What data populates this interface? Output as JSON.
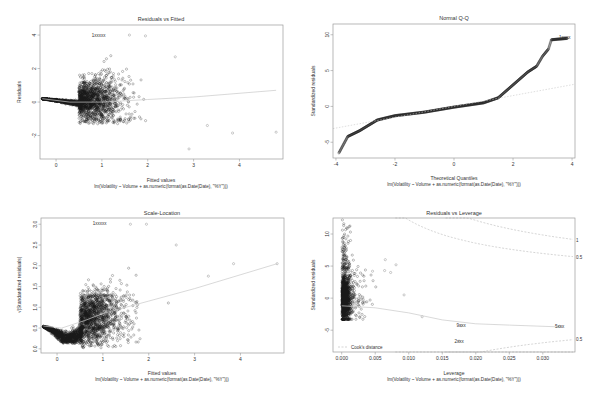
{
  "figure": {
    "subtitle": "lm(Volatility ~ Volume + as.numeric(format(as.Date(Date), \"%Y\")))",
    "colors": {
      "axis": "#9a9a9a",
      "points": "#1a1a1a",
      "smooth": "#c8c8c8",
      "cook": "#b8b8b8",
      "text": "#333333"
    }
  },
  "chart_data": [
    {
      "type": "scatter",
      "title": "Residuals vs Fitted",
      "xlabel": "Fitted values",
      "ylabel": "Residuals",
      "subtitle": "lm(Volatility ~ Volume + as.numeric(format(as.Date(Date), \"%Y\")))",
      "xlim": [
        -0.35,
        4.95
      ],
      "ylim": [
        -3.4,
        4.6
      ],
      "xticks": [
        0,
        1,
        2,
        3,
        4
      ],
      "yticks": [
        -2,
        0,
        2,
        4
      ],
      "box": [
        40,
        25,
        283,
        159
      ],
      "annotations": [
        {
          "label": "1xxxxx",
          "x": 0.93,
          "y": 4.0
        }
      ],
      "smooth_line": [
        [
          -0.3,
          0.2
        ],
        [
          0.3,
          0.0
        ],
        [
          1.0,
          0.0
        ],
        [
          2.0,
          0.15
        ],
        [
          3.0,
          0.3
        ],
        [
          4.8,
          0.7
        ]
      ],
      "notable_points": [
        [
          3.3,
          -1.4
        ],
        [
          3.85,
          -1.85
        ],
        [
          4.8,
          -1.8
        ],
        [
          2.9,
          -2.8
        ],
        [
          2.6,
          2.7
        ],
        [
          1.6,
          4.0
        ],
        [
          1.95,
          3.95
        ]
      ]
    },
    {
      "type": "scatter",
      "title": "Normal Q-Q",
      "xlabel": "Theoretical Quantiles",
      "ylabel": "Standardized residuals",
      "subtitle": "lm(Volatility ~ Volume + as.numeric(format(as.Date(Date), \"%Y\")))",
      "xlim": [
        -4.1,
        4.1
      ],
      "ylim": [
        -7.2,
        11.5
      ],
      "xticks": [
        -4,
        -2,
        0,
        2,
        4
      ],
      "yticks": [
        -5,
        0,
        5,
        10
      ],
      "box": [
        333,
        24,
        575,
        158
      ],
      "annotations": [
        {
          "label": "1xxxx",
          "x": 3.75,
          "y": 9.6
        }
      ],
      "reference_line": [
        [
          -4.1,
          -3.1
        ],
        [
          4.1,
          3.1
        ]
      ],
      "qq_curve": [
        [
          -3.9,
          -6.5
        ],
        [
          -3.6,
          -4.2
        ],
        [
          -3.2,
          -3.4
        ],
        [
          -2.6,
          -1.9
        ],
        [
          -2.0,
          -1.3
        ],
        [
          -1.0,
          -0.8
        ],
        [
          0.0,
          -0.1
        ],
        [
          1.0,
          0.5
        ],
        [
          1.5,
          1.2
        ],
        [
          2.0,
          3.0
        ],
        [
          2.5,
          4.8
        ],
        [
          2.8,
          5.6
        ],
        [
          3.0,
          7.0
        ],
        [
          3.2,
          8.0
        ],
        [
          3.3,
          9.3
        ],
        [
          3.85,
          9.5
        ]
      ]
    },
    {
      "type": "scatter",
      "title": "Scale-Location",
      "xlabel": "Fitted values",
      "ylabel": "√|Standardized residuals|",
      "subtitle": "lm(Volatility ~ Volume + as.numeric(format(as.Date(Date), \"%Y\")))",
      "xlim": [
        -0.35,
        4.95
      ],
      "ylim": [
        -0.1,
        3.15
      ],
      "xticks": [
        0,
        1,
        2,
        3,
        4
      ],
      "yticks": [
        0.0,
        0.5,
        1.0,
        1.5,
        2.0,
        2.5,
        3.0
      ],
      "box": [
        41,
        218,
        284,
        353
      ],
      "annotations": [
        {
          "label": "1xxxxx",
          "x": 0.93,
          "y": 3.02
        }
      ],
      "smooth_line": [
        [
          -0.3,
          0.55
        ],
        [
          0.1,
          0.5
        ],
        [
          0.6,
          0.68
        ],
        [
          1.0,
          0.85
        ],
        [
          1.5,
          1.0
        ],
        [
          2.0,
          1.15
        ],
        [
          3.0,
          1.45
        ],
        [
          4.8,
          2.05
        ]
      ],
      "notable_points": [
        [
          3.85,
          2.05
        ],
        [
          4.8,
          2.05
        ],
        [
          3.3,
          1.75
        ],
        [
          2.6,
          2.5
        ],
        [
          1.6,
          3.0
        ],
        [
          1.95,
          3.0
        ]
      ]
    },
    {
      "type": "scatter",
      "title": "Residuals vs Leverage",
      "xlabel": "Leverage",
      "ylabel": "Standardized residuals",
      "subtitle": "lm(Volatility ~ Volume + as.numeric(format(as.Date(Date), \"%Y\")))",
      "xlim": [
        -0.0013,
        0.0348
      ],
      "ylim": [
        -8.4,
        12.5
      ],
      "xticks": [
        0.0,
        0.005,
        0.01,
        0.015,
        0.02,
        0.025,
        0.03
      ],
      "xtick_labels": [
        "0.000",
        "0.005",
        "0.010",
        "0.015",
        "0.020",
        "0.025",
        "0.030"
      ],
      "yticks": [
        -5,
        0,
        5,
        10
      ],
      "box": [
        333,
        218,
        575,
        352
      ],
      "legend": {
        "label": "Cook's distance",
        "position": "bottomleft"
      },
      "annotations": [
        {
          "label": "9xxx",
          "x": 0.0178,
          "y": -4.3
        },
        {
          "label": "5xxx",
          "x": 0.0325,
          "y": -4.4
        },
        {
          "label": "2xxx",
          "x": 0.0175,
          "y": -6.7
        }
      ],
      "contour_labels": [
        {
          "label": "1",
          "x": 0.0348,
          "y": 9.0
        },
        {
          "label": "0.5",
          "x": 0.0348,
          "y": 6.3
        },
        {
          "label": "0.5",
          "x": 0.0348,
          "y": -6.4
        }
      ],
      "smooth_line": [
        [
          0.0,
          -1.2
        ],
        [
          0.005,
          -1.5
        ],
        [
          0.01,
          -2.3
        ],
        [
          0.015,
          -3.4
        ],
        [
          0.02,
          -4.0
        ],
        [
          0.025,
          -4.2
        ],
        [
          0.033,
          -4.5
        ]
      ],
      "notable_points": [
        [
          0.0065,
          6.0
        ],
        [
          0.0081,
          5.2
        ],
        [
          0.0064,
          4.3
        ],
        [
          0.0073,
          4.0
        ],
        [
          0.0046,
          4.2
        ],
        [
          0.0093,
          0.5
        ],
        [
          0.012,
          -2.9
        ],
        [
          0.0325,
          -4.4
        ],
        [
          0.0178,
          -4.3
        ],
        [
          0.0175,
          -6.7
        ]
      ]
    }
  ]
}
